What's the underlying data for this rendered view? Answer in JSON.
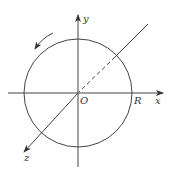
{
  "diagram": {
    "labels": {
      "y_axis": "y",
      "x_axis": "x",
      "z_axis": "z",
      "origin": "O",
      "radius_point": "R"
    },
    "colors": {
      "stroke": "#444444",
      "background": "#ffffff"
    },
    "elements": [
      "circle centered at O with radius R",
      "x-axis with arrow",
      "y-axis with arrow",
      "z-axis (diagonal) with arrow, dashed inside circle behind origin",
      "curved arrow indicating counter-clockwise rotation"
    ]
  }
}
